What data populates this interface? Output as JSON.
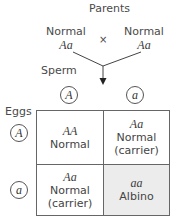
{
  "title": "Parents",
  "parents": [
    {
      "phenotype": "Normal",
      "genotype": "Aa"
    },
    {
      "phenotype": "Normal",
      "genotype": "Aa"
    }
  ],
  "cross_symbol": "×",
  "sperm_label": "Sperm",
  "eggs_label": "Eggs",
  "sperm_alleles": [
    "A",
    "a"
  ],
  "egg_alleles": [
    "A",
    "a"
  ],
  "punnett": [
    [
      {
        "genotype": "AA",
        "phenotype": "Normal",
        "note": ""
      },
      {
        "genotype": "Aa",
        "phenotype": "Normal",
        "note": "(carrier)"
      }
    ],
    [
      {
        "genotype": "Aa",
        "phenotype": "Normal",
        "note": "(carrier)"
      },
      {
        "genotype": "aa",
        "phenotype": "Albino",
        "note": ""
      }
    ]
  ],
  "colors": {
    "albino_cell": "#ececec",
    "line": "#444444"
  }
}
